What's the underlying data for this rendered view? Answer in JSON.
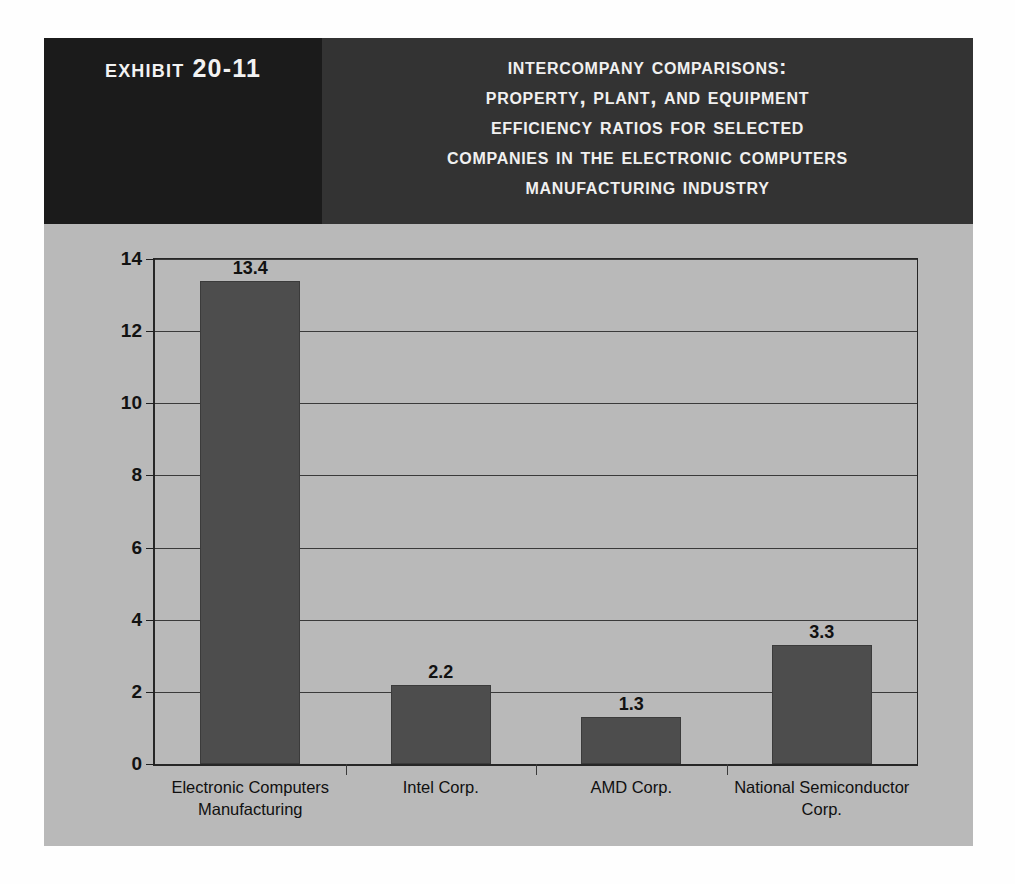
{
  "exhibit": {
    "label": "Exhibit 20-11"
  },
  "title": {
    "lines": [
      "Intercompany Comparisons:",
      "Property, Plant, and Equipment",
      "Efficiency Ratios for Selected",
      "Companies in the Electronic Computers",
      "Manufacturing Industry"
    ]
  },
  "colors": {
    "header_dark": "#1b1b1b",
    "header_title": "#333333",
    "panel_bg": "#b9b9b9",
    "bar_fill": "#4d4d4d",
    "axis": "#262626",
    "text_light": "#f0f0f0",
    "text_dark": "#111111"
  },
  "chart_data": {
    "type": "bar",
    "title": "Intercompany Comparisons: Property, Plant, and Equipment Efficiency Ratios for Selected Companies in the Electronic Computers Manufacturing Industry",
    "xlabel": "",
    "ylabel": "",
    "ylim": [
      0,
      14
    ],
    "ytick_step": 2,
    "yticks": [
      0,
      2,
      4,
      6,
      8,
      10,
      12,
      14
    ],
    "ytick_labels": [
      "0",
      "2",
      "4",
      "6",
      "8",
      "10",
      "12",
      "14"
    ],
    "grid": true,
    "legend": false,
    "categories": [
      "Electronic Computers Manufacturing",
      "Intel Corp.",
      "AMD Corp.",
      "National Semiconductor Corp."
    ],
    "category_lines": [
      [
        "Electronic Computers",
        "Manufacturing"
      ],
      [
        "Intel Corp."
      ],
      [
        "AMD Corp."
      ],
      [
        "National Semiconductor",
        "Corp."
      ]
    ],
    "values": [
      13.4,
      2.2,
      1.3,
      3.3
    ],
    "value_labels": [
      "13.4",
      "2.2",
      "1.3",
      "3.3"
    ]
  }
}
